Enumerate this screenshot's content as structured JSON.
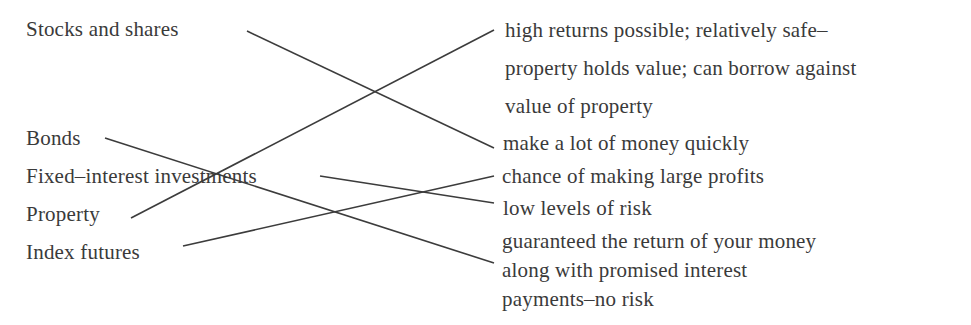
{
  "left_items": [
    {
      "id": "stocks",
      "label": "Stocks and shares"
    },
    {
      "id": "bonds",
      "label": "Bonds"
    },
    {
      "id": "fixed",
      "label": "Fixed–interest investments"
    },
    {
      "id": "property",
      "label": "Property"
    },
    {
      "id": "index",
      "label": "Index futures"
    }
  ],
  "right_items": [
    {
      "id": "r1",
      "lines": [
        "high returns possible;  relatively safe–",
        "property holds value;  can borrow against",
        "value of property"
      ]
    },
    {
      "id": "r2",
      "lines": [
        "make a lot of money quickly"
      ]
    },
    {
      "id": "r3",
      "lines": [
        "chance of making large profits"
      ]
    },
    {
      "id": "r4",
      "lines": [
        "low levels of risk"
      ]
    },
    {
      "id": "r5",
      "lines": [
        "guaranteed the return of your money",
        "along with promised interest",
        "payments–no risk"
      ]
    }
  ],
  "connections": [
    {
      "from": "Stocks and shares",
      "to": "make a lot of money quickly"
    },
    {
      "from": "Bonds",
      "to": "guaranteed the return of your money along with promised interest payments–no risk"
    },
    {
      "from": "Fixed–interest investments",
      "to": "low levels of risk"
    },
    {
      "from": "Property",
      "to": "high returns possible; relatively safe–property holds value; can borrow against value of property"
    },
    {
      "from": "Index futures",
      "to": "chance of making large profits"
    }
  ],
  "colors": {
    "text": "#3a3a3a",
    "line": "#3c3c3c",
    "background": "#ffffff"
  }
}
